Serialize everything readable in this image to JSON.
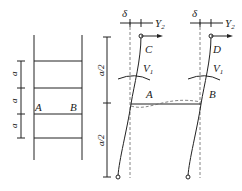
{
  "left_frame": {
    "dimensions": [
      "a",
      "a",
      "a"
    ],
    "node_labels": {
      "left": "A",
      "right": "B"
    }
  },
  "right_frame": {
    "dimensions": [
      "a/2",
      "a/2"
    ],
    "top_labels": {
      "delta_left": "δ",
      "delta_right": "δ",
      "Y_left": "Y",
      "Y_right": "Y",
      "Y_sub": "2"
    },
    "column_labels": {
      "C": "C",
      "D": "D",
      "A": "A",
      "B": "B"
    },
    "shear_labels": {
      "V_left": "V",
      "V_right": "V",
      "V_sub": "1"
    }
  }
}
